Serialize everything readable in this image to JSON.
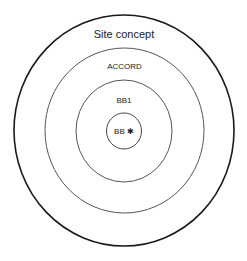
{
  "diagram": {
    "rings": [
      {
        "label": "Site concept",
        "cx": 124,
        "cy": 130.5,
        "rx": 110,
        "ry": 115.5,
        "stroke": "#1a1a1a",
        "width": 1.6,
        "label_y": 34,
        "font_size": 11
      },
      {
        "label": "ACCORD",
        "cx": 124.5,
        "cy": 130.5,
        "rx": 79.5,
        "ry": 82.5,
        "stroke": "#555555",
        "width": 1.0,
        "label_y": 66,
        "font_size": 8
      },
      {
        "label": "BB1",
        "cx": 124,
        "cy": 131,
        "rx": 48,
        "ry": 51,
        "stroke": "#555555",
        "width": 1.0,
        "label_y": 100,
        "font_size": 8
      },
      {
        "label": "BB ✱",
        "cx": 124,
        "cy": 131,
        "rx": 17.5,
        "ry": 18,
        "stroke": "#444444",
        "width": 1.0,
        "label_y": 131,
        "font_size": 8
      }
    ]
  }
}
